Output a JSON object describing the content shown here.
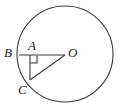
{
  "figure": {
    "type": "geometry-diagram",
    "background_color": "#ffffff",
    "stroke_color": "#3a3a3a",
    "label_color": "#1c1c1c",
    "labels": {
      "B": "B",
      "A": "A",
      "O": "O",
      "C": "C"
    },
    "points": {
      "O": {
        "x": 65,
        "y": 55
      },
      "A": {
        "x": 30,
        "y": 55
      },
      "B": {
        "x": 19,
        "y": 55
      },
      "C": {
        "x": 30,
        "y": 80
      }
    },
    "circle": {
      "cx": 65,
      "cy": 54,
      "r": 48
    },
    "segments": [
      {
        "name": "BO",
        "from": "B",
        "to": "O"
      },
      {
        "name": "AC",
        "from": "A",
        "to": "C"
      },
      {
        "name": "CO",
        "from": "C",
        "to": "O"
      }
    ],
    "right_angle": {
      "at": "A",
      "size": 7,
      "marker": "square"
    }
  }
}
